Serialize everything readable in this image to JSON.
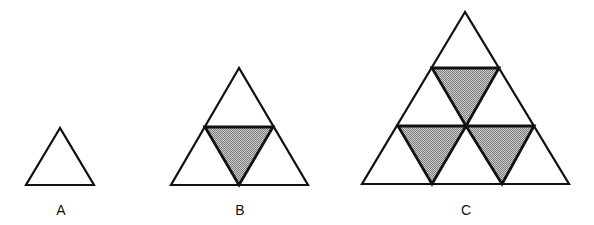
{
  "figure": {
    "colors": {
      "stroke": "#111111",
      "shade_light": "#d0d0d0",
      "shade_dark": "#7a7a7a",
      "background": "#ffffff"
    },
    "panels": [
      {
        "label": "A",
        "levels": 1,
        "shaded_triangles": 0
      },
      {
        "label": "B",
        "levels": 2,
        "shaded_triangles": 1
      },
      {
        "label": "C",
        "levels": 3,
        "shaded_triangles": 3
      }
    ]
  }
}
